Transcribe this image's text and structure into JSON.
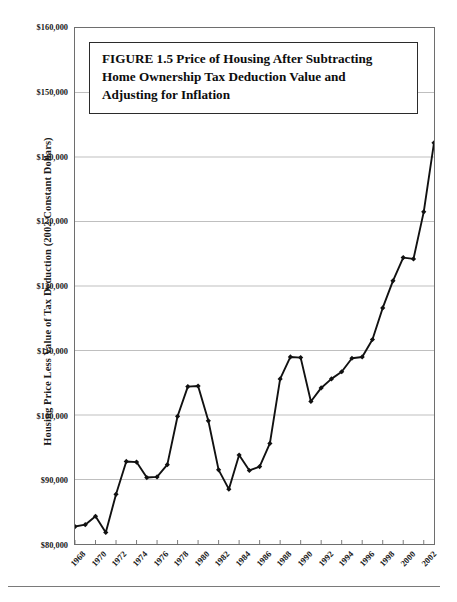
{
  "figure": {
    "title_lines": [
      "FIGURE 1.5  Price of Housing After Subtracting",
      "Home Ownership Tax Deduction Value and",
      "Adjusting for Inflation"
    ],
    "footer_caption": ""
  },
  "axes": {
    "y_title": "Housing Price Less Value of Tax Deduction (2002 Constant Dollars)",
    "y_tick_labels": [
      "$160,000",
      "$150,000",
      "$140,000",
      "$130,000",
      "$120,000",
      "$110,000",
      "$100,000",
      "$90,000",
      "$80,000"
    ],
    "x_tick_labels": [
      "1968",
      "1970",
      "1972",
      "1974",
      "1976",
      "1978",
      "1980",
      "1982",
      "1984",
      "1986",
      "1988",
      "1990",
      "1992",
      "1994",
      "1996",
      "1998",
      "2000",
      "2002"
    ]
  },
  "style": {
    "line_color": "#111111",
    "marker_color": "#111111",
    "grid_color": "#b7b7b7",
    "frame_color": "#6e6e6e"
  },
  "chart_data": {
    "type": "line",
    "xlabel": "",
    "ylabel": "Housing Price Less Value of Tax Deduction (2002 Constant Dollars)",
    "xlim": [
      1968,
      2003
    ],
    "ylim": [
      80000,
      160000
    ],
    "ytick_values": [
      160000,
      150000,
      140000,
      130000,
      120000,
      110000,
      100000,
      90000,
      80000
    ],
    "xtick_values": [
      1968,
      1970,
      1972,
      1974,
      1976,
      1978,
      1980,
      1982,
      1984,
      1986,
      1988,
      1990,
      1992,
      1994,
      1996,
      1998,
      2000,
      2002
    ],
    "grid": true,
    "legend": false,
    "markers": "diamond",
    "x": [
      1968,
      1969,
      1970,
      1971,
      1972,
      1973,
      1974,
      1975,
      1976,
      1977,
      1978,
      1979,
      1980,
      1981,
      1982,
      1983,
      1984,
      1985,
      1986,
      1987,
      1988,
      1989,
      1990,
      1991,
      1992,
      1993,
      1994,
      1995,
      1996,
      1997,
      1998,
      1999,
      2000,
      2001,
      2002,
      2003
    ],
    "values": [
      82700,
      83000,
      84300,
      81800,
      87700,
      92800,
      92700,
      90300,
      90400,
      92300,
      99800,
      104400,
      104500,
      99100,
      91500,
      88500,
      93800,
      91400,
      92000,
      95600,
      105600,
      109000,
      108900,
      102100,
      104200,
      105600,
      106700,
      108800,
      109000,
      111700,
      116600,
      120800,
      124400,
      124200,
      131500,
      142200
    ],
    "series": [
      {
        "name": "Housing price less tax deduction value",
        "values": [
          82700,
          83000,
          84300,
          81800,
          87700,
          92800,
          92700,
          90300,
          90400,
          92300,
          99800,
          104400,
          104500,
          99100,
          91500,
          88500,
          93800,
          91400,
          92000,
          95600,
          105600,
          109000,
          108900,
          102100,
          104200,
          105600,
          106700,
          108800,
          109000,
          111700,
          116600,
          120800,
          124400,
          124200,
          131500,
          142200
        ]
      }
    ]
  }
}
